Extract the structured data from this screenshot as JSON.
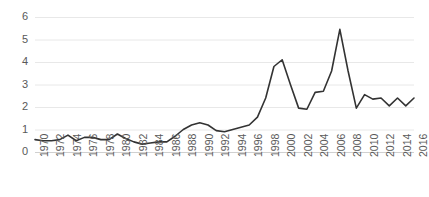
{
  "chart_data": {
    "type": "line",
    "title": "",
    "subtitle": "",
    "xlabel": "",
    "ylabel": "",
    "xlim": [
      1970,
      2016
    ],
    "ylim": [
      0,
      6
    ],
    "grid": true,
    "legend": false,
    "legend_position": "none",
    "line_color": "#333333",
    "grid_color": "#e8e8e8",
    "tick_label_color": "#595959",
    "y_ticks": [
      0,
      1,
      2,
      3,
      4,
      5,
      6
    ],
    "y_tick_labels": [
      "0",
      "1",
      "2",
      "3",
      "4",
      "5",
      "6"
    ],
    "x_ticks": [
      1970,
      1972,
      1974,
      1976,
      1978,
      1980,
      1982,
      1984,
      1986,
      1988,
      1990,
      1992,
      1994,
      1996,
      1998,
      2000,
      2002,
      2004,
      2006,
      2008,
      2010,
      2012,
      2014,
      2016
    ],
    "x_tick_labels": [
      "1970",
      "1972",
      "1974",
      "1976",
      "1978",
      "1980",
      "1982",
      "1984",
      "1986",
      "1988",
      "1990",
      "1992",
      "1994",
      "1996",
      "1998",
      "2000",
      "2002",
      "2004",
      "2006",
      "2008",
      "2010",
      "2012",
      "2014",
      "2016"
    ],
    "x": [
      1970,
      1971,
      1972,
      1973,
      1974,
      1975,
      1976,
      1977,
      1978,
      1979,
      1980,
      1981,
      1982,
      1983,
      1984,
      1985,
      1986,
      1987,
      1988,
      1989,
      1990,
      1991,
      1992,
      1993,
      1994,
      1995,
      1996,
      1997,
      1998,
      1999,
      2000,
      2001,
      2002,
      2003,
      2004,
      2005,
      2006,
      2007,
      2008,
      2009,
      2010,
      2011,
      2012,
      2013,
      2014,
      2015,
      2016
    ],
    "values": [
      0.55,
      0.5,
      0.5,
      0.55,
      0.75,
      0.5,
      0.65,
      0.65,
      0.55,
      0.55,
      0.8,
      0.6,
      0.45,
      0.35,
      0.4,
      0.45,
      0.45,
      0.7,
      1.0,
      1.2,
      1.3,
      1.2,
      0.95,
      0.9,
      1.0,
      1.1,
      1.2,
      1.55,
      2.4,
      3.8,
      4.1,
      3.0,
      1.95,
      1.9,
      2.65,
      2.7,
      3.6,
      5.45,
      3.6,
      1.95,
      2.55,
      2.35,
      2.4,
      2.05,
      2.4,
      2.05,
      2.4
    ]
  }
}
